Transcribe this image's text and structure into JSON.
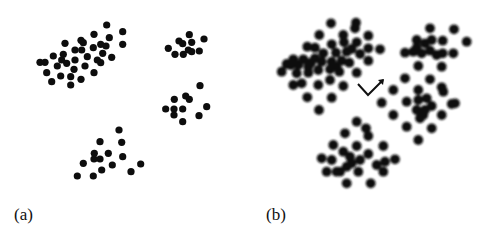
{
  "figure": {
    "panels": [
      {
        "id": "a",
        "label": "(a)",
        "dot_radius": 3.6,
        "dot_color": "#0a0a0a",
        "blur": 0.5
      },
      {
        "id": "b",
        "label": "(b)",
        "dot_radius": 4.9,
        "dot_color": "#111111",
        "blur": 1.0
      }
    ],
    "scale": 3,
    "panel_a_clusters": [
      [
        [
          320,
          75
        ],
        [
          368,
          95
        ],
        [
          282,
          103
        ],
        [
          328,
          113
        ],
        [
          243,
          121
        ],
        [
          250,
          128
        ],
        [
          195,
          130
        ],
        [
          302,
          133
        ],
        [
          368,
          133
        ],
        [
          225,
          150
        ],
        [
          280,
          143
        ],
        [
          318,
          138
        ],
        [
          160,
          168
        ],
        [
          190,
          163
        ],
        [
          262,
          170
        ],
        [
          308,
          160
        ],
        [
          335,
          172
        ],
        [
          120,
          187
        ],
        [
          135,
          187
        ],
        [
          185,
          180
        ],
        [
          225,
          180
        ],
        [
          292,
          180
        ],
        [
          302,
          188
        ],
        [
          172,
          198
        ],
        [
          255,
          198
        ],
        [
          140,
          218
        ],
        [
          222,
          208
        ],
        [
          282,
          218
        ],
        [
          182,
          228
        ],
        [
          212,
          230
        ],
        [
          243,
          238
        ],
        [
          155,
          245
        ],
        [
          212,
          255
        ],
        [
          200,
          190
        ],
        [
          245,
          150
        ]
      ],
      [
        [
          568,
          104
        ],
        [
          612,
          117
        ],
        [
          537,
          123
        ],
        [
          548,
          131
        ],
        [
          575,
          127
        ],
        [
          505,
          145
        ],
        [
          565,
          150
        ],
        [
          598,
          153
        ],
        [
          525,
          163
        ],
        [
          550,
          163
        ],
        [
          575,
          155
        ]
      ],
      [
        [
          600,
          257
        ],
        [
          557,
          288
        ],
        [
          568,
          298
        ],
        [
          523,
          298
        ],
        [
          497,
          327
        ],
        [
          522,
          327
        ],
        [
          548,
          327
        ],
        [
          620,
          320
        ],
        [
          522,
          345
        ],
        [
          597,
          347
        ],
        [
          548,
          365
        ]
      ],
      [
        [
          357,
          390
        ],
        [
          300,
          425
        ],
        [
          365,
          427
        ],
        [
          283,
          460
        ],
        [
          325,
          460
        ],
        [
          282,
          477
        ],
        [
          300,
          477
        ],
        [
          368,
          470
        ],
        [
          250,
          490
        ],
        [
          337,
          495
        ],
        [
          305,
          510
        ],
        [
          422,
          492
        ],
        [
          393,
          515
        ],
        [
          232,
          528
        ],
        [
          280,
          528
        ]
      ]
    ],
    "panel_b_offset_x": 250,
    "panel_b_clusters": [
      [
        [
          243,
          70
        ],
        [
          318,
          68
        ],
        [
          315,
          85
        ],
        [
          208,
          105
        ],
        [
          280,
          105
        ],
        [
          355,
          107
        ],
        [
          172,
          140
        ],
        [
          195,
          143
        ],
        [
          245,
          133
        ],
        [
          282,
          127
        ],
        [
          320,
          127
        ],
        [
          305,
          147
        ],
        [
          355,
          145
        ],
        [
          390,
          148
        ],
        [
          130,
          178
        ],
        [
          160,
          178
        ],
        [
          195,
          175
        ],
        [
          220,
          160
        ],
        [
          258,
          158
        ],
        [
          290,
          155
        ],
        [
          330,
          162
        ],
        [
          95,
          215
        ],
        [
          122,
          195
        ],
        [
          145,
          195
        ],
        [
          175,
          200
        ],
        [
          215,
          185
        ],
        [
          245,
          185
        ],
        [
          275,
          182
        ],
        [
          298,
          188
        ],
        [
          355,
          182
        ],
        [
          140,
          220
        ],
        [
          175,
          218
        ],
        [
          205,
          210
        ],
        [
          240,
          208
        ],
        [
          268,
          215
        ],
        [
          320,
          218
        ],
        [
          130,
          255
        ],
        [
          155,
          250
        ],
        [
          205,
          255
        ],
        [
          240,
          240
        ],
        [
          280,
          258
        ],
        [
          172,
          292
        ],
        [
          245,
          293
        ],
        [
          207,
          330
        ],
        [
          110,
          192
        ],
        [
          183,
          188
        ],
        [
          260,
          200
        ]
      ],
      [
        [
          540,
          85
        ],
        [
          612,
          88
        ],
        [
          650,
          125
        ],
        [
          500,
          120
        ],
        [
          525,
          130
        ],
        [
          545,
          120
        ],
        [
          578,
          122
        ],
        [
          465,
          158
        ],
        [
          490,
          155
        ],
        [
          515,
          160
        ],
        [
          540,
          152
        ],
        [
          560,
          165
        ],
        [
          578,
          160
        ],
        [
          610,
          160
        ],
        [
          505,
          198
        ],
        [
          575,
          200
        ],
        [
          500,
          143
        ]
      ],
      [
        [
          465,
          235
        ],
        [
          540,
          238
        ],
        [
          430,
          270
        ],
        [
          505,
          270
        ],
        [
          575,
          262
        ],
        [
          580,
          275
        ],
        [
          395,
          308
        ],
        [
          470,
          305
        ],
        [
          505,
          300
        ],
        [
          530,
          295
        ],
        [
          545,
          318
        ],
        [
          500,
          330
        ],
        [
          525,
          330
        ],
        [
          605,
          312
        ],
        [
          615,
          310
        ],
        [
          430,
          345
        ],
        [
          510,
          355
        ],
        [
          575,
          345
        ],
        [
          470,
          380
        ],
        [
          545,
          385
        ],
        [
          505,
          420
        ],
        [
          520,
          345
        ]
      ],
      [
        [
          320,
          365
        ],
        [
          348,
          385
        ],
        [
          285,
          400
        ],
        [
          355,
          408
        ],
        [
          400,
          438
        ],
        [
          250,
          435
        ],
        [
          320,
          438
        ],
        [
          280,
          455
        ],
        [
          300,
          470
        ],
        [
          355,
          462
        ],
        [
          215,
          475
        ],
        [
          245,
          480
        ],
        [
          330,
          480
        ],
        [
          405,
          485
        ],
        [
          435,
          478
        ],
        [
          230,
          515
        ],
        [
          260,
          515
        ],
        [
          290,
          500
        ],
        [
          325,
          515
        ],
        [
          380,
          495
        ],
        [
          400,
          515
        ],
        [
          290,
          550
        ],
        [
          362,
          550
        ],
        [
          270,
          515
        ],
        [
          305,
          490
        ]
      ]
    ],
    "arrow": {
      "points": [
        [
          358,
          84
        ],
        [
          368,
          95
        ],
        [
          383,
          80
        ]
      ],
      "color": "#111111",
      "icon": "v-arrow-icon"
    }
  }
}
